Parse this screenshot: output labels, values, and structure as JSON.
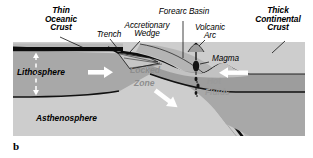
{
  "figure": {
    "panel_letter": "b",
    "type": "subduction-zone-cross-section"
  },
  "labels": {
    "thin_oceanic_crust": "Thin\nOceanic\nCrust",
    "trench": "Trench",
    "accretionary_wedge": "Accretionary\nWedge",
    "forearc_basin": "Forearc Basin",
    "volcanic_arc": "Volcanic\nArc",
    "thick_continental_crust": "Thick\nContinental\nCrust",
    "lithosphere": "Lithosphere",
    "asthenosphere": "Asthenosphere",
    "locked_zone_line1": "Locked",
    "locked_zone_line2": "Zone",
    "magma": "Magma",
    "hot_fluids_line1": "Hot",
    "hot_fluids_line2": "Fluids"
  },
  "colors": {
    "page_background": "#ffffff",
    "panel_background": "#cfcfcf",
    "asthenosphere_fill": "#cdcdcd",
    "lithosphere_fill": "#a8a8a8",
    "oceanic_crust_fill": "#0d0d0d",
    "continental_crust_fill": "#9d9d9d",
    "forearc_fill": "#c2c2c2",
    "slab_fill": "#b4b4b4",
    "wedge_fill": "#bdbdbd",
    "magma_fill": "#141414",
    "arrow_fill": "#ffffff",
    "outline": "#111111",
    "ghost_text": "#8d8d8d"
  },
  "arrows": {
    "oceanic_plate_motion": "right",
    "continental_plate_motion": "left",
    "slab_sinking": "down-right",
    "crust_thickness_indicator": "vertical-double"
  }
}
